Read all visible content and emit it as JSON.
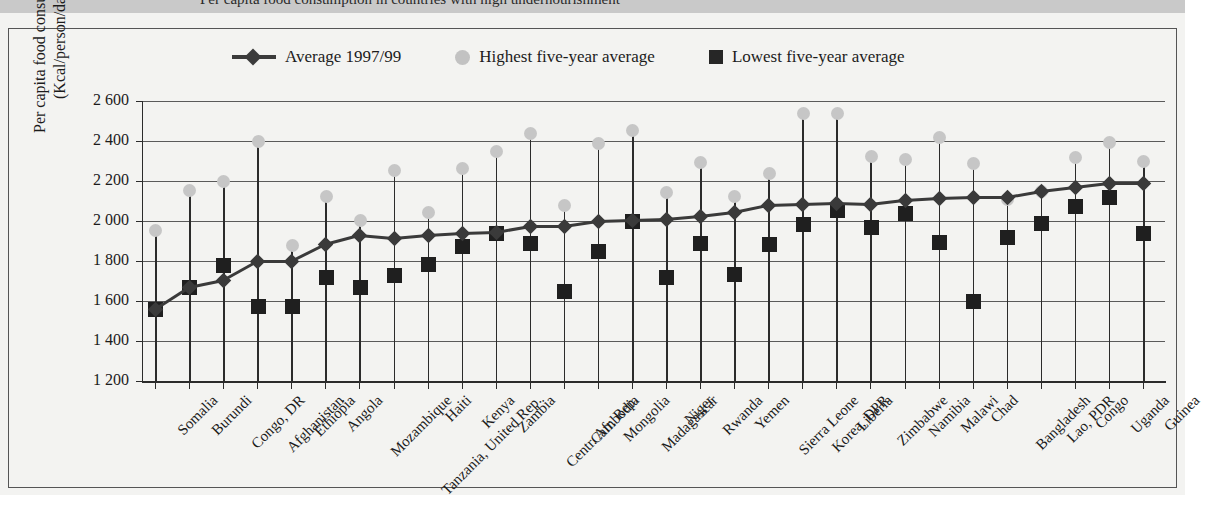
{
  "title_band": {
    "title": "Per capita food consumption in countries with high undernourishment"
  },
  "legend": {
    "items": [
      {
        "key": "average",
        "label": "Average 1997/99",
        "marker": "line-diamond",
        "color": "#3b3b3b"
      },
      {
        "key": "highest",
        "label": "Highest five-year average",
        "marker": "circle",
        "color": "#c2c2c2"
      },
      {
        "key": "lowest",
        "label": "Lowest five-year average",
        "marker": "square",
        "color": "#262626"
      }
    ]
  },
  "axes": {
    "ylabel_line1": "Per capita food consumption",
    "ylabel_line2": "(Kcal/person/day)",
    "yticks": [
      "2 600",
      "2 400",
      "2 200",
      "2 000",
      "1 800",
      "1 600",
      "1 400",
      "1 200"
    ]
  },
  "chart_data": {
    "type": "line",
    "title": "Per capita food consumption in countries with high undernourishment",
    "xlabel": "",
    "ylabel": "Per capita food consumption (Kcal/person/day)",
    "ylim": [
      1200,
      2600
    ],
    "ytick_values": [
      1200,
      1400,
      1600,
      1800,
      2000,
      2200,
      2400,
      2600
    ],
    "grid": true,
    "legend_position": "top",
    "categories": [
      "Somalia",
      "Burundi",
      "Congo, DR",
      "Afghanistan",
      "Ethiopia",
      "Angola",
      "Mozambique",
      "Tanzania, United Rep.",
      "Haiti",
      "Kenya",
      "Zambia",
      "Centr. Afr. Rep.",
      "Cambodia",
      "Mongolia",
      "Madagascar",
      "Niger",
      "Rwanda",
      "Yemen",
      "Sierra Leone",
      "Korea, DPR",
      "Liberia",
      "Zimbabwe",
      "Namibia",
      "Malawi",
      "Chad",
      "Bangladesh",
      "Lao, PDR",
      "Congo",
      "Uganda",
      "Guinea"
    ],
    "series": [
      {
        "name": "Average 1997/99",
        "marker": "diamond",
        "color": "#3a3a3a",
        "values": [
          1560,
          1670,
          1705,
          1800,
          1800,
          1885,
          1930,
          1915,
          1930,
          1940,
          1945,
          1975,
          1975,
          2000,
          2005,
          2010,
          2025,
          2045,
          2080,
          2085,
          2090,
          2085,
          2105,
          2115,
          2120,
          2120,
          2150,
          2170,
          2190,
          2190
        ]
      },
      {
        "name": "Highest five-year average",
        "marker": "circle",
        "color": "#c6c6c6",
        "values": [
          1955,
          2155,
          2200,
          2400,
          1880,
          2125,
          2005,
          2255,
          2045,
          2265,
          2350,
          2440,
          2080,
          2390,
          2455,
          2145,
          2295,
          2125,
          2240,
          2540,
          2540,
          2325,
          2310,
          2420,
          2290,
          2110,
          2150,
          2320,
          2395,
          2300
        ]
      },
      {
        "name": "Lowest five-year average",
        "marker": "square",
        "color": "#1f1f1f",
        "values": [
          1560,
          1670,
          1780,
          1575,
          1575,
          1720,
          1670,
          1730,
          1785,
          1875,
          1940,
          1890,
          1650,
          1850,
          2000,
          1720,
          1890,
          1735,
          1885,
          1985,
          2055,
          1970,
          2040,
          1895,
          1600,
          1920,
          1990,
          2075,
          2120,
          1940
        ]
      }
    ]
  }
}
